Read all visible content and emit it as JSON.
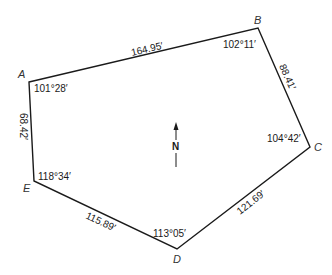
{
  "diagram": {
    "type": "traverse-polygon",
    "vertices": [
      {
        "name": "A",
        "angle": "101°28′"
      },
      {
        "name": "B",
        "angle": "102°11′"
      },
      {
        "name": "C",
        "angle": "104°42′"
      },
      {
        "name": "D",
        "angle": "113°05′"
      },
      {
        "name": "E",
        "angle": "118°34′"
      }
    ],
    "sides": [
      {
        "from": "A",
        "to": "B",
        "length": "164.95′"
      },
      {
        "from": "B",
        "to": "C",
        "length": "88.41′"
      },
      {
        "from": "C",
        "to": "D",
        "length": "121.69′"
      },
      {
        "from": "D",
        "to": "E",
        "length": "115.89′"
      },
      {
        "from": "E",
        "to": "A",
        "length": "68.42′"
      }
    ],
    "north_arrow": {
      "label": "N"
    },
    "line_color": "#1a1a1a"
  }
}
